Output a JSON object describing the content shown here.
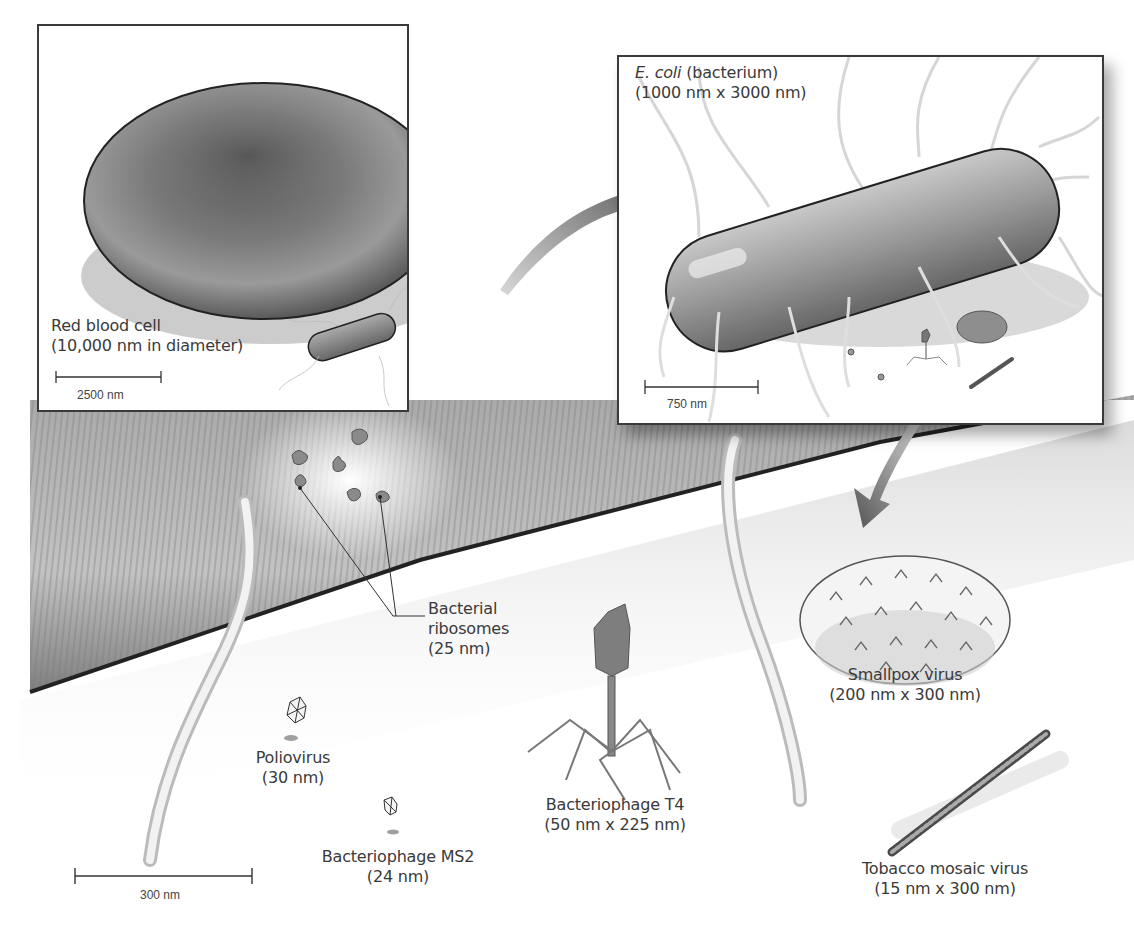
{
  "figure": {
    "colors": {
      "outline": "#3a3a3a",
      "cell_fill": "#7a7a7a",
      "background": "#ffffff",
      "text": "#3a3a3a"
    }
  },
  "panels": {
    "red_blood_cell": {
      "label_line1": "Red blood cell",
      "label_line2": "(10,000 nm in diameter)",
      "scale_bar": "2500 nm"
    },
    "ecoli": {
      "label_italic": "E. coli",
      "label_rest": " (bacterium)",
      "label_line2": "(1000 nm x 3000 nm)",
      "scale_bar": "750 nm"
    }
  },
  "main_view": {
    "scale_bar": "300 nm",
    "items": [
      {
        "name": "Bacterial ribosomes",
        "line1": "Bacterial",
        "line2": "ribosomes",
        "size": "(25 nm)"
      },
      {
        "name": "Poliovirus",
        "line1": "Poliovirus",
        "size": "(30 nm)"
      },
      {
        "name": "Bacteriophage MS2",
        "line1": "Bacteriophage MS2",
        "size": "(24 nm)"
      },
      {
        "name": "Bacteriophage T4",
        "line1": "Bacteriophage T4",
        "size": "(50 nm x 225 nm)"
      },
      {
        "name": "Smallpox virus",
        "line1": "Smallpox virus",
        "size": "(200 nm x 300 nm)"
      },
      {
        "name": "Tobacco mosaic virus",
        "line1": "Tobacco mosaic virus",
        "size": "(15 nm x 300 nm)"
      }
    ]
  }
}
